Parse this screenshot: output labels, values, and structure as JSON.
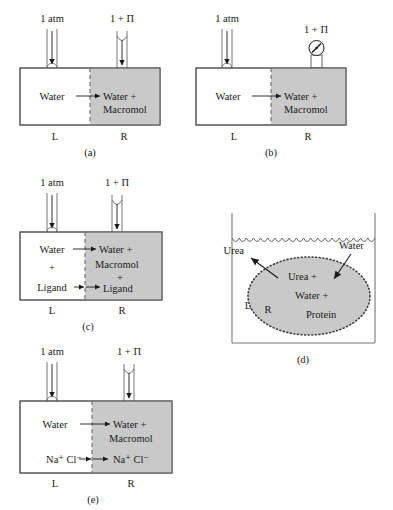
{
  "figure": {
    "colors": {
      "shaded_fill": "#c9c9c9",
      "outline": "#555555",
      "text": "#1a1a1a",
      "membrane": "#6b6b6b"
    }
  },
  "panels": [
    {
      "id": "a",
      "caption": "(a)",
      "left_pressure": "1 atm",
      "right_pressure": "1 + Π",
      "left_compartment": "Water",
      "right_compartment_line1": "Water +",
      "right_compartment_line2": "Macromol",
      "left_side_label": "L",
      "right_side_label": "R",
      "flow_arrow": "water-flow-right",
      "right_top_device": "open-tube"
    },
    {
      "id": "b",
      "caption": "(b)",
      "left_pressure": "1 atm",
      "right_pressure": "1 + Π",
      "left_compartment": "Water",
      "right_compartment_line1": "Water +",
      "right_compartment_line2": "Macromol",
      "left_side_label": "L",
      "right_side_label": "R",
      "flow_arrow": "water-flow-right",
      "right_top_device": "pressure-gauge"
    },
    {
      "id": "c",
      "caption": "(c)",
      "left_pressure": "1 atm",
      "right_pressure": "1 + Π",
      "left_lines": [
        "Water",
        "+",
        "Ligand"
      ],
      "right_lines": [
        "Water +",
        "Macromol",
        "+",
        "Ligand"
      ],
      "left_side_label": "L",
      "right_side_label": "R",
      "flow_arrow": "water-flow-right",
      "exchange_arrow": "ligand-exchange-both",
      "right_top_device": "open-tube"
    },
    {
      "id": "d",
      "caption": "(d)",
      "outside_label_left": "Urea",
      "outside_label_right": "Water",
      "bag_lines": [
        "Urea +",
        "Water +",
        "Protein"
      ],
      "left_side_label": "L",
      "right_side_label": "R",
      "vessel": "beaker-with-water-surface",
      "bag": "dotted-dialysis-bag"
    },
    {
      "id": "e",
      "caption": "(e)",
      "left_pressure": "1 atm",
      "right_pressure": "1 + Π",
      "left_compartment": "Water",
      "right_compartment_line1": "Water +",
      "right_compartment_line2": "Macromol",
      "left_salt": "Na⁺ Cl⁻",
      "right_salt": "Na⁺ Cl⁻",
      "left_side_label": "L",
      "right_side_label": "R",
      "flow_arrow": "water-flow-right",
      "exchange_arrow": "salt-exchange-both",
      "right_top_device": "open-tube"
    }
  ]
}
